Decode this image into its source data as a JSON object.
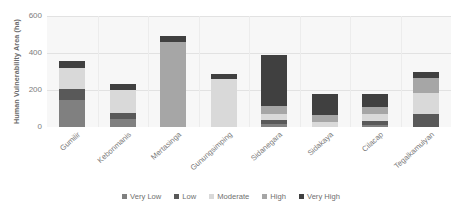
{
  "chart_data": {
    "type": "bar",
    "stacked": true,
    "title": "",
    "xlabel": "",
    "ylabel": "Human Vulnerability Area (ha)",
    "ylim": [
      0,
      600
    ],
    "yticks": [
      0,
      200,
      400,
      600
    ],
    "ytick_labels": [
      "0",
      "200",
      "400",
      "600"
    ],
    "grid": true,
    "legend_position": "bottom",
    "categories": [
      "Gumilir",
      "Kebonmanis",
      "Mertasinga",
      "Gunungsimping",
      "Sidanegara",
      "Sidakaya",
      "Cilacap",
      "Tegalkamulyan"
    ],
    "series": [
      {
        "name": "Very Low",
        "color": "#808080",
        "values": [
          148,
          45,
          0,
          0,
          18,
          0,
          12,
          0
        ]
      },
      {
        "name": "Low",
        "color": "#595959",
        "values": [
          55,
          30,
          0,
          0,
          22,
          0,
          18,
          72
        ]
      },
      {
        "name": "Moderate",
        "color": "#d9d9d9",
        "values": [
          118,
          125,
          0,
          262,
          28,
          28,
          40,
          112
        ]
      },
      {
        "name": "High",
        "color": "#a6a6a6",
        "values": [
          0,
          0,
          458,
          0,
          48,
          38,
          38,
          82
        ]
      },
      {
        "name": "Very High",
        "color": "#404040",
        "values": [
          36,
          35,
          32,
          22,
          275,
          112,
          72,
          30
        ]
      }
    ],
    "totals": [
      357,
      235,
      490,
      284,
      391,
      178,
      180,
      296
    ]
  },
  "legend": {
    "items": [
      {
        "label": "Very Low",
        "color": "#808080"
      },
      {
        "label": "Low",
        "color": "#595959"
      },
      {
        "label": "Moderate",
        "color": "#d9d9d9"
      },
      {
        "label": "High",
        "color": "#a6a6a6"
      },
      {
        "label": "Very High",
        "color": "#404040"
      }
    ]
  },
  "style": {
    "plot_background": "#f7f7f7",
    "gridline_color": "#e2e2e2",
    "text_color": "#6f6f6f"
  }
}
